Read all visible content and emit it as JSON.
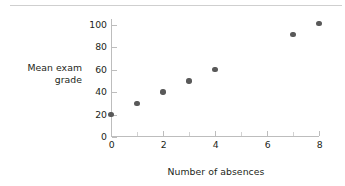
{
  "chart_data": {
    "type": "scatter",
    "title": "",
    "xlabel": "Number of absences",
    "ylabel": "Mean exam grade",
    "ylabel_lines": [
      "Mean exam",
      "grade"
    ],
    "x": [
      0,
      1,
      2,
      3,
      4,
      7,
      8
    ],
    "values": [
      20,
      30,
      40,
      50,
      60,
      91,
      101
    ],
    "points": [
      {
        "x": 0,
        "y": 20
      },
      {
        "x": 1,
        "y": 30
      },
      {
        "x": 2,
        "y": 40
      },
      {
        "x": 3,
        "y": 50
      },
      {
        "x": 4,
        "y": 60
      },
      {
        "x": 7,
        "y": 91
      },
      {
        "x": 8,
        "y": 101
      }
    ],
    "xlim": [
      0,
      8
    ],
    "ylim": [
      0,
      105
    ],
    "xticks": [
      0,
      2,
      4,
      6,
      8
    ],
    "xtick_labels": [
      "0",
      "2",
      "4",
      "6",
      "8"
    ],
    "xticks_minor": [
      1,
      3,
      5,
      7
    ],
    "yticks": [
      0,
      20,
      40,
      60,
      80,
      100
    ],
    "ytick_labels": [
      "0",
      "20",
      "40",
      "60",
      "80",
      "100"
    ],
    "grid": false,
    "legend": null,
    "marker_color": "#595959",
    "axis_color": "#bdbdbd",
    "text_color": "#231f20",
    "background": "#ffffff",
    "top_rule_color": "#cfcfcf"
  }
}
